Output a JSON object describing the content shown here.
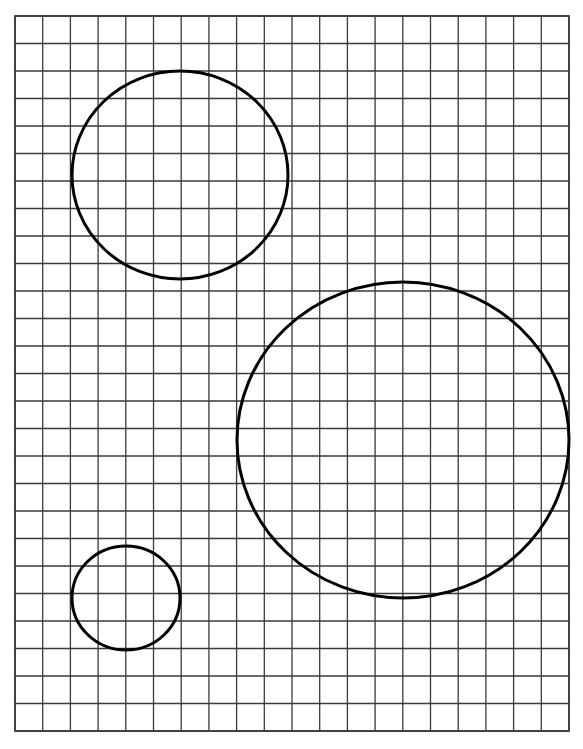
{
  "diagram": {
    "type": "grid-with-circles",
    "background": "#ffffff",
    "grid": {
      "x": 15,
      "y": 16,
      "width": 554,
      "height": 715,
      "columns": 20,
      "rows": 26,
      "line_color": "#3a3a3a",
      "line_width": 1.3
    },
    "circles": [
      {
        "name": "circle-large-top-left",
        "cx": 180,
        "cy": 175,
        "rx": 108,
        "ry": 104,
        "stroke": "#000000",
        "stroke_width": 3
      },
      {
        "name": "circle-largest-right",
        "cx": 403,
        "cy": 440,
        "rx": 166,
        "ry": 158,
        "stroke": "#000000",
        "stroke_width": 3
      },
      {
        "name": "circle-small-bottom-left",
        "cx": 126,
        "cy": 598,
        "rx": 54,
        "ry": 52,
        "stroke": "#000000",
        "stroke_width": 3
      }
    ]
  }
}
